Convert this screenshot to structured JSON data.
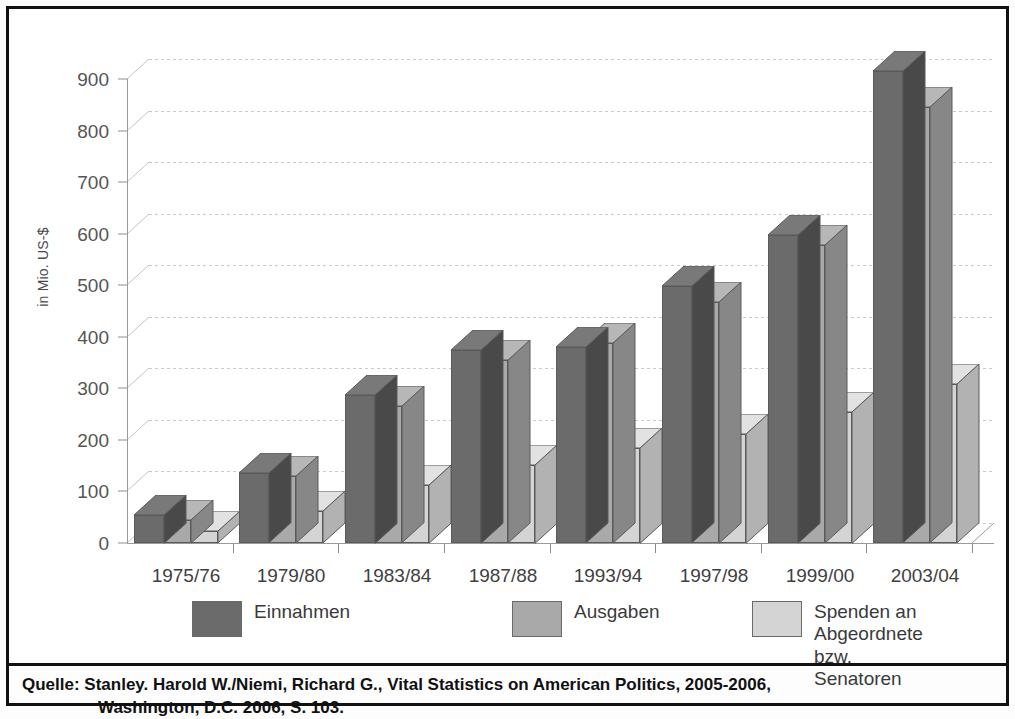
{
  "chart_data": {
    "type": "bar",
    "title": "",
    "subtitle": "",
    "xlabel": "",
    "ylabel": "in Mio. US-$",
    "ylim": [
      0,
      900
    ],
    "yticks": [
      0,
      100,
      200,
      300,
      400,
      500,
      600,
      700,
      800,
      900
    ],
    "grid": true,
    "legend_position": "bottom",
    "style": "3d grouped bars, grayscale",
    "categories": [
      "1975/76",
      "1979/80",
      "1983/84",
      "1987/88",
      "1993/94",
      "1997/98",
      "1999/00",
      "2003/04"
    ],
    "series": [
      {
        "name": "Einnahmen",
        "color": "#6b6b6b",
        "values": [
          55,
          135,
          288,
          375,
          380,
          498,
          598,
          915
        ]
      },
      {
        "name": "Ausgaben",
        "color": "#a9a9a9",
        "values": [
          45,
          130,
          265,
          355,
          388,
          468,
          578,
          845
        ]
      },
      {
        "name": "Spenden an Abgeordnete bzw. Senatoren",
        "color": "#d4d4d4",
        "values": [
          23,
          62,
          113,
          152,
          185,
          212,
          255,
          308
        ]
      }
    ]
  },
  "axis": {
    "y_title": "in Mio. US-$",
    "y_tick_labels": [
      "900",
      "800",
      "700",
      "600",
      "500",
      "400",
      "300",
      "200",
      "100",
      "0"
    ],
    "x_tick_labels": [
      "1975/76",
      "1979/80",
      "1983/84",
      "1987/88",
      "1993/94",
      "1997/98",
      "1999/00",
      "2003/04"
    ]
  },
  "legend": {
    "items": [
      {
        "label": "Einnahmen",
        "color": "#6b6b6b"
      },
      {
        "label": "Ausgaben",
        "color": "#a9a9a9"
      },
      {
        "label": "Spenden an Abgeordnete\nbzw. Senatoren",
        "color": "#d4d4d4"
      }
    ]
  },
  "source": {
    "line1": "Quelle: Stanley. Harold W./Niemi, Richard G., Vital Statistics on American Politics, 2005-2006,",
    "line2": "Washington, D.C. 2006, S. 103."
  }
}
